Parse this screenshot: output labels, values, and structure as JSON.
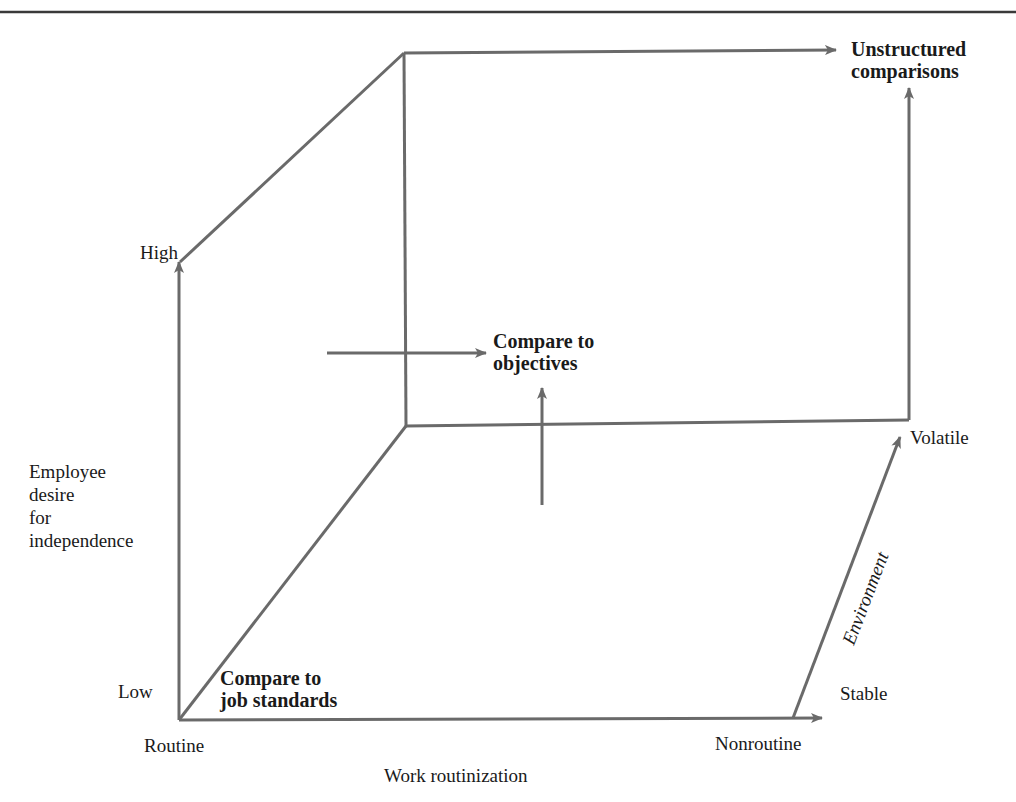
{
  "figure": {
    "colors": {
      "line": "#6a6a6a",
      "rule": "#3a3a3a",
      "text": "#1a1a1a"
    },
    "labels": {
      "unstructured": "Unstructured\ncomparisons",
      "objectives": "Compare to\nobjectives",
      "job_standards": "Compare to\njob standards",
      "high": "High",
      "low": "Low",
      "y_axis_title": "Employee\ndesire\nfor\nindependence",
      "routine": "Routine",
      "nonroutine": "Nonroutine",
      "x_axis_title": "Work routinization",
      "stable": "Stable",
      "volatile": "Volatile",
      "z_axis_title": "Environment"
    },
    "axes": {
      "x": {
        "title": "Work routinization",
        "low": "Routine",
        "high": "Nonroutine"
      },
      "y": {
        "title": "Employee desire for independence",
        "low": "Low",
        "high": "High"
      },
      "z": {
        "title": "Environment",
        "low": "Stable",
        "high": "Volatile"
      }
    },
    "approaches": [
      "Compare to job standards",
      "Compare to objectives",
      "Unstructured comparisons"
    ]
  }
}
